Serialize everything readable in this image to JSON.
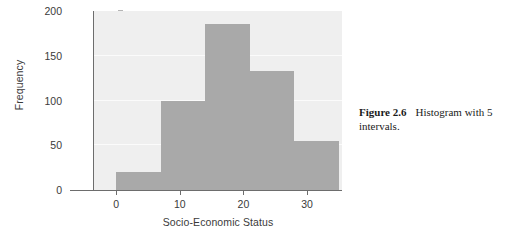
{
  "chart_data": {
    "type": "bar",
    "subtype": "histogram",
    "title": "",
    "xlabel": "Socio-Economic Status",
    "ylabel": "Frequency",
    "xlim": [
      -3.5,
      35.5
    ],
    "ylim": [
      0,
      200
    ],
    "grid": true,
    "legend": null,
    "bin_width": 7,
    "bin_count": 5,
    "bin_edges": [
      0,
      7,
      14,
      21,
      28,
      35
    ],
    "categories": [
      "0-7",
      "7-14",
      "14-21",
      "21-28",
      "28-35"
    ],
    "values": [
      20,
      100,
      185,
      133,
      55
    ],
    "xticks": [
      0,
      10,
      20,
      30
    ],
    "xtick_labels": [
      "0",
      "10",
      "20",
      "30"
    ],
    "yticks": [
      0,
      50,
      100,
      150,
      200
    ],
    "ytick_labels": [
      "0",
      "50",
      "100",
      "150",
      "200"
    ],
    "bar_color": "#a9a9a9",
    "plot_background": "#efefef",
    "gridline_color": "#fbfbfb",
    "axis_color": "#6d6d6d"
  },
  "caption": {
    "label": "Figure 2.6",
    "text": "Histogram with 5 intervals."
  }
}
